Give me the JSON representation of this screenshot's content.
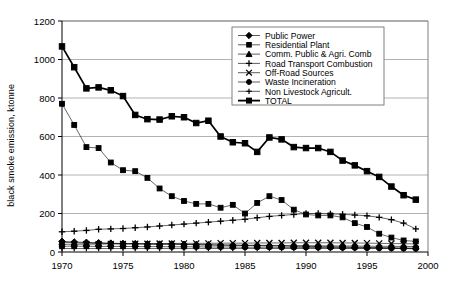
{
  "chart_data": {
    "type": "line",
    "title": "",
    "xlabel": "",
    "ylabel": "black smoke emission, ktonne",
    "xlim": [
      1970,
      2000
    ],
    "ylim": [
      0,
      1200
    ],
    "ytick_step": 200,
    "xtick_step": 5,
    "grid": "horizontal",
    "legend_position": "top-right-inside",
    "yticks": [
      "0",
      "200",
      "400",
      "600",
      "800",
      "1000",
      "1200"
    ],
    "xticks": [
      "1970",
      "1975",
      "1980",
      "1985",
      "1990",
      "1995",
      "2000"
    ],
    "x": [
      1970,
      1971,
      1972,
      1973,
      1974,
      1975,
      1976,
      1977,
      1978,
      1979,
      1980,
      1981,
      1982,
      1983,
      1984,
      1985,
      1986,
      1987,
      1988,
      1989,
      1990,
      1991,
      1992,
      1993,
      1994,
      1995,
      1996,
      1997,
      1998,
      1999
    ],
    "series": [
      {
        "name": "Public Power",
        "marker": "diamond",
        "values": [
          55,
          52,
          50,
          48,
          46,
          44,
          43,
          42,
          41,
          42,
          40,
          38,
          37,
          36,
          35,
          34,
          33,
          32,
          31,
          30,
          29,
          28,
          27,
          26,
          25,
          24,
          23,
          22,
          21,
          20
        ]
      },
      {
        "name": "Residential Plant",
        "marker": "square",
        "values": [
          770,
          660,
          545,
          540,
          465,
          425,
          420,
          385,
          330,
          290,
          265,
          250,
          250,
          230,
          245,
          200,
          255,
          290,
          270,
          220,
          195,
          190,
          190,
          180,
          150,
          130,
          95,
          75,
          60,
          55
        ]
      },
      {
        "name": "Comm. Public & Agri. Comb",
        "marker": "triangle",
        "values": [
          50,
          48,
          46,
          45,
          44,
          43,
          42,
          41,
          40,
          40,
          39,
          38,
          37,
          36,
          36,
          35,
          35,
          34,
          34,
          33,
          33,
          32,
          32,
          31,
          31,
          30,
          30,
          29,
          29,
          28
        ]
      },
      {
        "name": "Road Transport Combustion",
        "marker": "cross-bar",
        "values": [
          105,
          108,
          112,
          118,
          120,
          122,
          126,
          130,
          135,
          140,
          145,
          150,
          155,
          160,
          165,
          170,
          178,
          185,
          190,
          195,
          200,
          200,
          198,
          196,
          192,
          188,
          180,
          168,
          150,
          120
        ]
      },
      {
        "name": "Off-Road Sources",
        "marker": "x",
        "values": [
          40,
          40,
          41,
          41,
          42,
          42,
          43,
          43,
          44,
          44,
          45,
          45,
          45,
          46,
          46,
          46,
          47,
          47,
          47,
          48,
          48,
          48,
          48,
          47,
          47,
          46,
          45,
          44,
          43,
          42
        ]
      },
      {
        "name": "Waste Incineration",
        "marker": "circle",
        "values": [
          30,
          30,
          30,
          29,
          29,
          29,
          28,
          28,
          28,
          27,
          27,
          27,
          26,
          26,
          26,
          25,
          25,
          25,
          24,
          24,
          24,
          23,
          23,
          22,
          22,
          21,
          20,
          19,
          18,
          17
        ]
      },
      {
        "name": "Non Livestock Agricult.",
        "marker": "plus",
        "values": [
          18,
          18,
          18,
          18,
          18,
          18,
          18,
          18,
          18,
          18,
          18,
          18,
          18,
          18,
          18,
          18,
          18,
          18,
          18,
          18,
          18,
          18,
          18,
          18,
          18,
          18,
          18,
          18,
          18,
          18
        ]
      },
      {
        "name": "TOTAL",
        "marker": "square-bold",
        "values": [
          1068,
          960,
          850,
          855,
          840,
          810,
          712,
          690,
          688,
          705,
          700,
          670,
          682,
          600,
          570,
          565,
          520,
          595,
          585,
          545,
          540,
          540,
          520,
          475,
          450,
          420,
          390,
          340,
          295,
          272
        ]
      }
    ]
  },
  "legend": {
    "items": [
      {
        "label": "Public Power"
      },
      {
        "label": "Residential Plant"
      },
      {
        "label": "Comm. Public & Agri. Comb"
      },
      {
        "label": "Road Transport Combustion"
      },
      {
        "label": "Off-Road Sources"
      },
      {
        "label": "Waste Incineration"
      },
      {
        "label": "Non Livestock Agricult."
      },
      {
        "label": "TOTAL"
      }
    ]
  }
}
